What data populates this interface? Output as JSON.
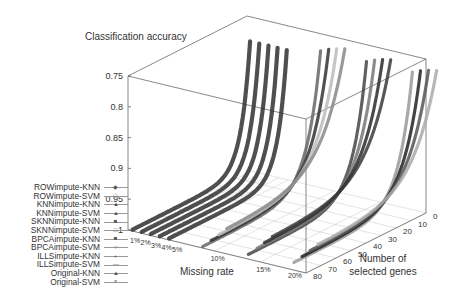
{
  "chart_data": {
    "type": "scatter3d",
    "title": "Classification accuracy",
    "zlabel": "Classification accuracy",
    "xlabel": "Missing rate",
    "ylabel": "Number of selected genes",
    "z_ticks": [
      "0.75",
      "0.8",
      "0.85",
      "0.9",
      "0.95",
      "1"
    ],
    "zlim": [
      1,
      0.75
    ],
    "x_ticks": [
      "1%",
      "2%",
      "3%",
      "4%",
      "5%",
      "10%",
      "15%",
      "20%"
    ],
    "y_ticks": [
      "0",
      "10",
      "20",
      "30",
      "40",
      "50",
      "60",
      "70",
      "80"
    ],
    "ylim": [
      0,
      80
    ],
    "grid": true,
    "legend_position": "lower-left",
    "series": [
      {
        "name": "ROWimpute-KNN",
        "marker": "diamond"
      },
      {
        "name": "ROWimpute-SVM",
        "marker": "open-diamond"
      },
      {
        "name": "KNNimpute-KNN",
        "marker": "triangle"
      },
      {
        "name": "KNNimpute-SVM",
        "marker": "filled-triangle"
      },
      {
        "name": "SKNNimpute-KNN",
        "marker": "filled-square"
      },
      {
        "name": "SKNNimpute-SVM",
        "marker": "open-square"
      },
      {
        "name": "BPCAimpute-KNN",
        "marker": "filled-square-small"
      },
      {
        "name": "BPCAimpute-SVM",
        "marker": "open-circle"
      },
      {
        "name": "ILLSimpute-KNN",
        "marker": "plus"
      },
      {
        "name": "ILLSimpute-SVM",
        "marker": "line"
      },
      {
        "name": "Original-KNN",
        "marker": "filled-triangle-small"
      },
      {
        "name": "Original-SVM",
        "marker": "cross"
      }
    ],
    "missing_rate_groups": [
      {
        "rate": "1%",
        "accuracy_at_1_gene": 0.77,
        "accuracy_at_80_genes": 0.99
      },
      {
        "rate": "2%",
        "accuracy_at_1_gene": 0.77,
        "accuracy_at_80_genes": 0.99
      },
      {
        "rate": "3%",
        "accuracy_at_1_gene": 0.77,
        "accuracy_at_80_genes": 0.99
      },
      {
        "rate": "4%",
        "accuracy_at_1_gene": 0.77,
        "accuracy_at_80_genes": 0.99
      },
      {
        "rate": "5%",
        "accuracy_at_1_gene": 0.77,
        "accuracy_at_80_genes": 0.99
      },
      {
        "rate": "10%",
        "accuracy_at_1_gene": 0.77,
        "accuracy_at_80_genes": 0.98
      },
      {
        "rate": "15%",
        "accuracy_at_1_gene": 0.77,
        "accuracy_at_80_genes": 0.97
      },
      {
        "rate": "20%",
        "accuracy_at_1_gene": 0.77,
        "accuracy_at_80_genes": 0.96
      }
    ]
  },
  "labels": {
    "title": "Classification accuracy",
    "xlabel": "Missing rate",
    "ylabel_line1": "Number of",
    "ylabel_line2": "selected genes"
  },
  "legend": [
    "ROWimpute-KNN",
    "ROWimpute-SVM",
    "KNNimpute-KNN",
    "KNNimpute-SVM",
    "SKNNimpute-KNN",
    "SKNNimpute-SVM",
    "BPCAimpute-KNN",
    "BPCAimpute-SVM",
    "ILLSimpute-KNN",
    "ILLSimpute-SVM",
    "Original-KNN",
    "Original-SVM"
  ],
  "legend_markers": [
    "◆",
    "◇",
    "▲",
    "▲",
    "■",
    "□",
    "■",
    "○",
    "+",
    "—",
    "▲",
    "×"
  ]
}
